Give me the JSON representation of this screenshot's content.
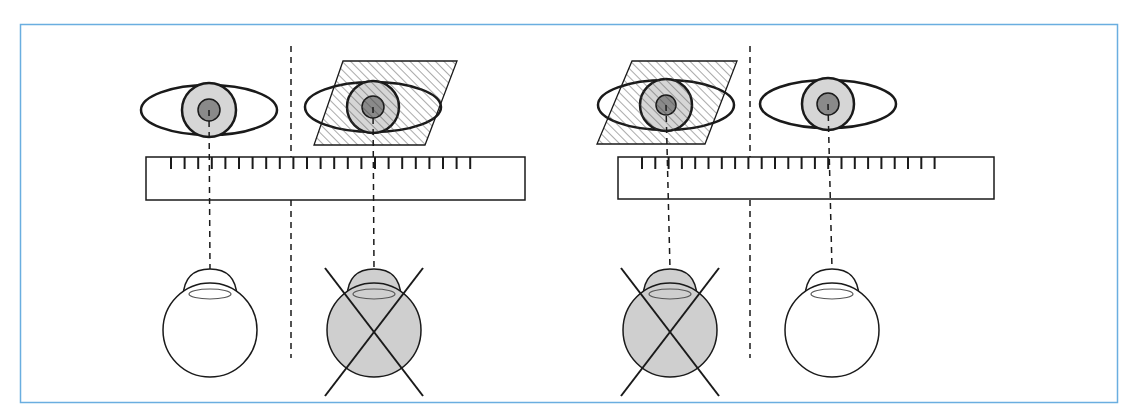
{
  "figure": {
    "description": "Eye alignment / cover test diagram: two panels, each with a pair of eyes viewed over a ruler; the occluded eye (hatched filter) is crossed out as a globe below",
    "frame_color": "#6aaee0",
    "colors": {
      "stroke": "#1a1a1a",
      "iris_fill": "#d6d6d6",
      "pupil_fill": "#8a8a8a",
      "globe_occluded_fill": "#cfcfcf",
      "hatch": "#444444"
    }
  },
  "panels": [
    {
      "name": "left-panel",
      "divider_x": 291,
      "ruler": {
        "x": 146,
        "y": 157,
        "w": 379,
        "h": 43,
        "tick_start": 171,
        "tick_step": 13.6,
        "tick_count": 23,
        "tick_len": 12
      },
      "eyes": [
        {
          "side": "right",
          "cx": 209,
          "cy": 110,
          "rx": 68,
          "ry": 25,
          "iris_r": 27,
          "pupil_r": 11,
          "occluded": false
        },
        {
          "side": "left",
          "cx": 373,
          "cy": 107,
          "rx": 68,
          "ry": 25,
          "iris_r": 26,
          "pupil_r": 11,
          "occluded": true,
          "filter": [
            [
              343,
              61
            ],
            [
              457,
              61
            ],
            [
              425,
              145
            ],
            [
              314,
              145
            ]
          ]
        }
      ],
      "globes": [
        {
          "cx": 210,
          "cy": 330,
          "r": 47,
          "occluded": false
        },
        {
          "cx": 374,
          "cy": 330,
          "r": 47,
          "occluded": true
        }
      ]
    },
    {
      "name": "right-panel",
      "divider_x": 750,
      "ruler": {
        "x": 618,
        "y": 157,
        "w": 376,
        "h": 42,
        "tick_start": 642,
        "tick_step": 13.3,
        "tick_count": 23,
        "tick_len": 12
      },
      "eyes": [
        {
          "side": "right",
          "cx": 666,
          "cy": 105,
          "rx": 68,
          "ry": 25,
          "iris_r": 26,
          "pupil_r": 10,
          "occluded": true,
          "filter": [
            [
              632,
              61
            ],
            [
              737,
              61
            ],
            [
              705,
              144
            ],
            [
              597,
              144
            ]
          ]
        },
        {
          "side": "left",
          "cx": 828,
          "cy": 104,
          "rx": 68,
          "ry": 24,
          "iris_r": 26,
          "pupil_r": 11,
          "occluded": false
        }
      ],
      "globes": [
        {
          "cx": 670,
          "cy": 330,
          "r": 47,
          "occluded": true
        },
        {
          "cx": 832,
          "cy": 330,
          "r": 47,
          "occluded": false
        }
      ]
    }
  ]
}
